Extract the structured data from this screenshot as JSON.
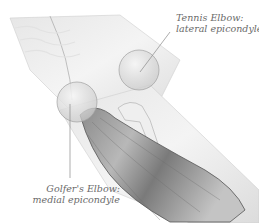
{
  "diagram": {
    "labels": [
      {
        "title": "Tennis Elbow:",
        "subtitle": "lateral epicondyle"
      },
      {
        "title": "Golfer's Elbow:",
        "subtitle": "medial epicondyle"
      }
    ]
  }
}
